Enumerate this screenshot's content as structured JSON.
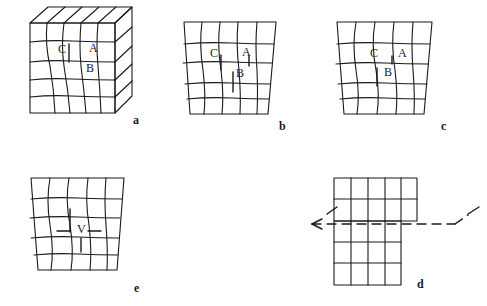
{
  "figure": {
    "background_color": "#ffffff",
    "stroke_color": "#1a1a1a",
    "width": 487,
    "height": 306,
    "panels": [
      {
        "id": "a",
        "label": "a",
        "label_x": 133,
        "label_y": 120,
        "kind": "block-3d-deformed-grid",
        "markers": [
          {
            "text": "C",
            "x": 58,
            "y": 48
          },
          {
            "text": "A",
            "x": 89,
            "y": 47
          },
          {
            "text": "B",
            "x": 86,
            "y": 68
          }
        ]
      },
      {
        "id": "b",
        "label": "b",
        "label_x": 279,
        "label_y": 126,
        "kind": "flat-deformed-grid",
        "markers": [
          {
            "text": "C",
            "x": 210,
            "y": 52
          },
          {
            "text": "A",
            "x": 242,
            "y": 51
          },
          {
            "text": "B",
            "x": 236,
            "y": 73
          }
        ]
      },
      {
        "id": "c",
        "label": "c",
        "label_x": 441,
        "label_y": 126,
        "kind": "flat-deformed-grid",
        "markers": [
          {
            "text": "C",
            "x": 370,
            "y": 52
          },
          {
            "text": "A",
            "x": 398,
            "y": 52
          },
          {
            "text": "B",
            "x": 384,
            "y": 72
          }
        ]
      },
      {
        "id": "e",
        "label": "e",
        "label_x": 134,
        "label_y": 288,
        "kind": "flat-deformed-grid-with-v",
        "markers": [
          {
            "text": "V",
            "x": 77,
            "y": 228
          }
        ]
      },
      {
        "id": "d",
        "label": "d",
        "label_x": 417,
        "label_y": 284,
        "kind": "offset-grid-with-dashed-arrow",
        "markers": []
      }
    ],
    "annotations": {
      "dashed_arrow": {
        "name": "slip-direction-arrow",
        "direction": "left",
        "style": "dashed"
      }
    },
    "marker_labels": [
      "A",
      "B",
      "C",
      "V"
    ],
    "panel_labels": [
      "a",
      "b",
      "c",
      "d",
      "e"
    ]
  }
}
